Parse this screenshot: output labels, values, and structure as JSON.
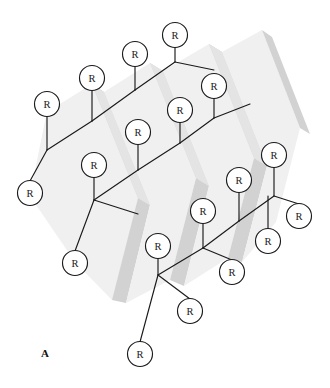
{
  "figure": {
    "panel_label": "A",
    "node_label": "R",
    "node_count": 21,
    "width": 330,
    "height": 388,
    "background_color": "#ffffff",
    "line_color": "#1a1a1a",
    "node_fill_color": "#ffffff",
    "band_light_color": "#f0f0f0",
    "band_mid_color": "#e4e4e4",
    "band_dark_color": "#d2d2d2",
    "node_radius": 12.5
  },
  "nodes": [
    {
      "id": "n1",
      "label": "R",
      "x": 175,
      "y": 35
    },
    {
      "id": "n2",
      "label": "R",
      "x": 135,
      "y": 54
    },
    {
      "id": "n3",
      "label": "R",
      "x": 92,
      "y": 78
    },
    {
      "id": "n4",
      "label": "R",
      "x": 47,
      "y": 104
    },
    {
      "id": "n5",
      "label": "R",
      "x": 214,
      "y": 86
    },
    {
      "id": "n6",
      "label": "R",
      "x": 180,
      "y": 110
    },
    {
      "id": "n7",
      "label": "R",
      "x": 138,
      "y": 132
    },
    {
      "id": "n8",
      "label": "R",
      "x": 94,
      "y": 165
    },
    {
      "id": "n9",
      "label": "R",
      "x": 30,
      "y": 193
    },
    {
      "id": "n10",
      "label": "R",
      "x": 274,
      "y": 155
    },
    {
      "id": "n11",
      "label": "R",
      "x": 239,
      "y": 180
    },
    {
      "id": "n12",
      "label": "R",
      "x": 203,
      "y": 211
    },
    {
      "id": "n13",
      "label": "R",
      "x": 158,
      "y": 246
    },
    {
      "id": "n14",
      "label": "R",
      "x": 75,
      "y": 263
    },
    {
      "id": "n15",
      "label": "R",
      "x": 299,
      "y": 216
    },
    {
      "id": "n16",
      "label": "R",
      "x": 268,
      "y": 241
    },
    {
      "id": "n17",
      "label": "R",
      "x": 232,
      "y": 272
    },
    {
      "id": "n18",
      "label": "R",
      "x": 190,
      "y": 311
    },
    {
      "id": "n19",
      "label": "R",
      "x": 140,
      "y": 354
    }
  ],
  "bonds": [
    {
      "id": "b1",
      "x1": 175,
      "y1": 47,
      "x2": 175,
      "y2": 62
    },
    {
      "id": "b2",
      "x1": 175,
      "y1": 62,
      "x2": 135,
      "y2": 90
    },
    {
      "id": "b3",
      "x1": 135,
      "y1": 66,
      "x2": 135,
      "y2": 90
    },
    {
      "id": "b4",
      "x1": 135,
      "y1": 90,
      "x2": 92,
      "y2": 121
    },
    {
      "id": "b5",
      "x1": 92,
      "y1": 90,
      "x2": 92,
      "y2": 121
    },
    {
      "id": "b6",
      "x1": 92,
      "y1": 121,
      "x2": 47,
      "y2": 150
    },
    {
      "id": "b7",
      "x1": 47,
      "y1": 116,
      "x2": 47,
      "y2": 150
    },
    {
      "id": "b8",
      "x1": 47,
      "y1": 150,
      "x2": 30,
      "y2": 181
    },
    {
      "id": "b9",
      "x1": 175,
      "y1": 62,
      "x2": 214,
      "y2": 70
    },
    {
      "id": "b10",
      "x1": 214,
      "y1": 98,
      "x2": 214,
      "y2": 118
    },
    {
      "id": "b11",
      "x1": 214,
      "y1": 118,
      "x2": 180,
      "y2": 143
    },
    {
      "id": "b12",
      "x1": 180,
      "y1": 122,
      "x2": 180,
      "y2": 143
    },
    {
      "id": "b13",
      "x1": 180,
      "y1": 143,
      "x2": 138,
      "y2": 170
    },
    {
      "id": "b14",
      "x1": 138,
      "y1": 144,
      "x2": 138,
      "y2": 170
    },
    {
      "id": "b15",
      "x1": 138,
      "y1": 170,
      "x2": 94,
      "y2": 200
    },
    {
      "id": "b16",
      "x1": 94,
      "y1": 177,
      "x2": 94,
      "y2": 200
    },
    {
      "id": "b17",
      "x1": 94,
      "y1": 200,
      "x2": 75,
      "y2": 251
    },
    {
      "id": "b18",
      "x1": 214,
      "y1": 118,
      "x2": 250,
      "y2": 104
    },
    {
      "id": "b19",
      "x1": 274,
      "y1": 167,
      "x2": 274,
      "y2": 196
    },
    {
      "id": "b20",
      "x1": 274,
      "y1": 196,
      "x2": 239,
      "y2": 221
    },
    {
      "id": "b21",
      "x1": 239,
      "y1": 192,
      "x2": 239,
      "y2": 221
    },
    {
      "id": "b22",
      "x1": 239,
      "y1": 221,
      "x2": 203,
      "y2": 248
    },
    {
      "id": "b23",
      "x1": 203,
      "y1": 223,
      "x2": 203,
      "y2": 248
    },
    {
      "id": "b24",
      "x1": 203,
      "y1": 248,
      "x2": 158,
      "y2": 275
    },
    {
      "id": "b25",
      "x1": 158,
      "y1": 258,
      "x2": 158,
      "y2": 275
    },
    {
      "id": "b26",
      "x1": 158,
      "y1": 275,
      "x2": 140,
      "y2": 342
    },
    {
      "id": "b27",
      "x1": 274,
      "y1": 196,
      "x2": 299,
      "y2": 204
    },
    {
      "id": "b28",
      "x1": 268,
      "y1": 196,
      "x2": 268,
      "y2": 229
    },
    {
      "id": "b29",
      "x1": 203,
      "y1": 248,
      "x2": 232,
      "y2": 260
    },
    {
      "id": "b30",
      "x1": 158,
      "y1": 275,
      "x2": 190,
      "y2": 299
    },
    {
      "id": "b31",
      "x1": 94,
      "y1": 200,
      "x2": 138,
      "y2": 214
    }
  ],
  "bands": [
    {
      "id": "band1",
      "tone": "light"
    },
    {
      "id": "band2",
      "tone": "dark"
    },
    {
      "id": "band3",
      "tone": "light"
    },
    {
      "id": "band4",
      "tone": "dark"
    },
    {
      "id": "band5",
      "tone": "light"
    },
    {
      "id": "band6",
      "tone": "dark"
    },
    {
      "id": "band7",
      "tone": "light"
    },
    {
      "id": "band8",
      "tone": "dark"
    }
  ]
}
